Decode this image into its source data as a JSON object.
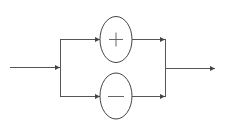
{
  "diagram": {
    "type": "parallel-branch block diagram",
    "input": {
      "label": ""
    },
    "branches": [
      {
        "symbol": "+",
        "name": "plus"
      },
      {
        "symbol": "−",
        "name": "minus"
      }
    ],
    "output": {
      "label": ""
    },
    "colors": {
      "line": "#555555",
      "background": "#ffffff"
    }
  }
}
